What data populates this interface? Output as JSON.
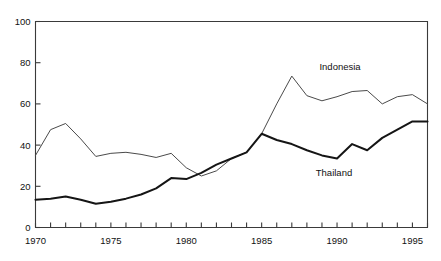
{
  "chart_data": {
    "type": "line",
    "title": "",
    "xlabel": "",
    "ylabel": "",
    "xlim": [
      1970,
      1996
    ],
    "ylim": [
      0,
      100
    ],
    "grid": false,
    "legend_position": "inline-annotations",
    "x": [
      1970,
      1971,
      1972,
      1973,
      1974,
      1975,
      1976,
      1977,
      1978,
      1979,
      1980,
      1981,
      1982,
      1983,
      1984,
      1985,
      1986,
      1987,
      1988,
      1989,
      1990,
      1991,
      1992,
      1993,
      1994,
      1995,
      1996
    ],
    "y_ticks": [
      0,
      20,
      40,
      60,
      80,
      100
    ],
    "y_tick_labels": [
      "0",
      "20",
      "40",
      "60",
      "80",
      "100"
    ],
    "x_ticks": [
      1970,
      1971,
      1972,
      1973,
      1974,
      1975,
      1976,
      1977,
      1978,
      1979,
      1980,
      1981,
      1982,
      1983,
      1984,
      1985,
      1986,
      1987,
      1988,
      1989,
      1990,
      1991,
      1992,
      1993,
      1994,
      1995,
      1996
    ],
    "x_tick_labels": [
      "1970",
      "1975",
      "1980",
      "1985",
      "1990",
      "1995"
    ],
    "x_labeled_values": [
      1970,
      1975,
      1980,
      1985,
      1990,
      1995
    ],
    "series": [
      {
        "name": "Indonesia",
        "style": "thin",
        "color": "#4a4a4a",
        "label_x": 1990.2,
        "label_y": 76.5,
        "values": [
          35.0,
          47.5,
          50.5,
          43.0,
          34.5,
          36.0,
          36.5,
          35.5,
          34.0,
          36.0,
          29.0,
          25.0,
          27.5,
          33.5,
          36.5,
          45.5,
          60.0,
          73.5,
          64.0,
          61.5,
          63.5,
          66.0,
          66.5,
          60.0,
          63.5,
          64.5,
          60.0
        ]
      },
      {
        "name": "Thailand",
        "style": "thick",
        "color": "#151515",
        "label_x": 1989.8,
        "label_y": 25.0,
        "values": [
          13.5,
          14.0,
          15.0,
          13.5,
          11.5,
          12.5,
          14.0,
          16.0,
          19.0,
          24.0,
          23.5,
          26.5,
          30.5,
          33.5,
          36.5,
          45.5,
          42.5,
          40.5,
          37.5,
          35.0,
          33.5,
          40.5,
          37.5,
          43.5,
          47.5,
          51.5,
          51.5
        ]
      }
    ],
    "annotations": [
      {
        "text": "Indonesia",
        "x": 1990.2,
        "y": 76.5
      },
      {
        "text": "Thailand",
        "x": 1989.8,
        "y": 25.0
      }
    ]
  }
}
